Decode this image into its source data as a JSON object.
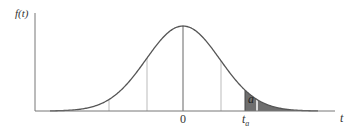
{
  "chart_data": {
    "type": "line",
    "title": "",
    "ylabel": "f(t)",
    "xlabel": "t",
    "x_tick_labels": [
      "0",
      "t_a"
    ],
    "annotations": [
      {
        "text": "a",
        "meaning": "shaded right-tail area beyond t_a"
      }
    ],
    "curve": "symmetric bell-shaped density (t distribution), peak at t = 0",
    "shaded_region": {
      "from": "t_a",
      "to": "+inf",
      "color": "#6b6b6b"
    },
    "reference_lines": [
      "-2sd",
      "-1sd",
      "0",
      "+1sd",
      "t_a"
    ],
    "grid": false,
    "legend": null
  },
  "labels": {
    "y_axis": "f(t)",
    "x_axis": "t",
    "zero": "0",
    "ta_main": "t",
    "ta_sub": "a",
    "area": "a"
  },
  "colors": {
    "curve": "#555555",
    "axis": "#777777",
    "ref_line": "#bbbbbb",
    "shade": "#6e6e6e"
  }
}
